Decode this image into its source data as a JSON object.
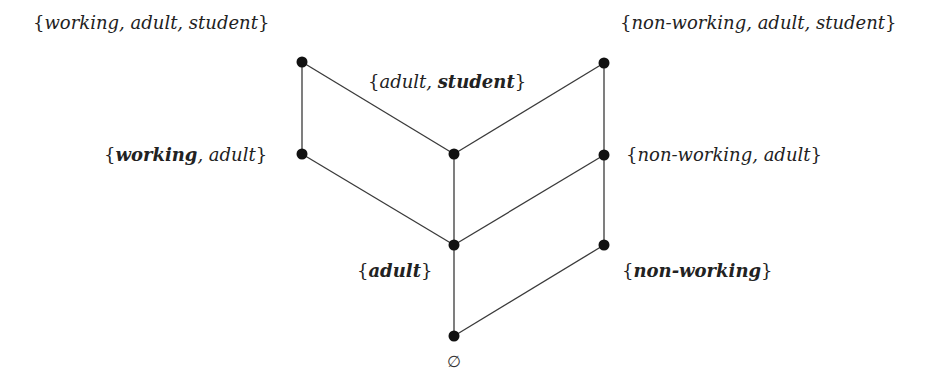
{
  "diagram": {
    "type": "hasse-lattice",
    "nodes": [
      {
        "id": "wAS",
        "x": 302,
        "y": 62
      },
      {
        "id": "nAS",
        "x": 604,
        "y": 63
      },
      {
        "id": "wA",
        "x": 302,
        "y": 154
      },
      {
        "id": "AS",
        "x": 454,
        "y": 154
      },
      {
        "id": "nA",
        "x": 604,
        "y": 155
      },
      {
        "id": "A",
        "x": 454,
        "y": 245
      },
      {
        "id": "n",
        "x": 604,
        "y": 245
      },
      {
        "id": "empty",
        "x": 454,
        "y": 336
      }
    ],
    "edges": [
      [
        "wAS",
        "wA"
      ],
      [
        "wAS",
        "AS"
      ],
      [
        "nAS",
        "AS"
      ],
      [
        "nAS",
        "nA"
      ],
      [
        "wA",
        "A"
      ],
      [
        "AS",
        "A"
      ],
      [
        "nA",
        "A"
      ],
      [
        "nA",
        "n"
      ],
      [
        "A",
        "empty"
      ],
      [
        "n",
        "empty"
      ]
    ],
    "labels": {
      "working_adult_student": {
        "open": "{",
        "parts": [
          {
            "t": "working",
            "b": false
          },
          {
            "t": ", adult, student",
            "b": false
          }
        ],
        "close": "}"
      },
      "non_working_adult_student": {
        "open": "{",
        "parts": [
          {
            "t": "non-working, adult, student",
            "b": false
          }
        ],
        "close": "}"
      },
      "adult_student": {
        "open": "{",
        "parts": [
          {
            "t": "adult, ",
            "b": false
          },
          {
            "t": "student",
            "b": true
          }
        ],
        "close": "}"
      },
      "working_adult": {
        "open": "{",
        "parts": [
          {
            "t": "working",
            "b": true
          },
          {
            "t": ", adult",
            "b": false
          }
        ],
        "close": "}"
      },
      "non_working_adult": {
        "open": "{",
        "parts": [
          {
            "t": "non-working, adult",
            "b": false
          }
        ],
        "close": "}"
      },
      "adult": {
        "open": "{",
        "parts": [
          {
            "t": "adult",
            "b": true
          }
        ],
        "close": "}"
      },
      "non_working": {
        "open": "{",
        "parts": [
          {
            "t": "non-working",
            "b": true
          }
        ],
        "close": "}"
      },
      "empty_set": "∅"
    },
    "colors": {
      "node": "#111111",
      "edge": "#3a3a3a",
      "text": "#222222"
    }
  }
}
